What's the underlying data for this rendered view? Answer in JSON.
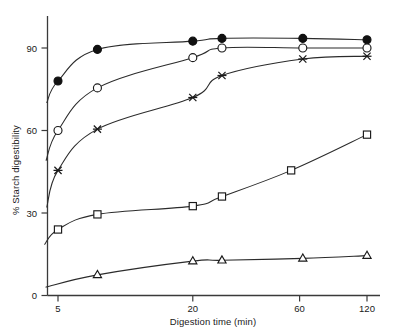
{
  "chart_data": {
    "type": "line",
    "title": "",
    "xlabel": "Digestion time (min)",
    "ylabel": "% Starch digestibility",
    "xscale": "log-like",
    "xticks": [
      5,
      20,
      60,
      120
    ],
    "xtick_labels": [
      "5",
      "20",
      "60",
      "120"
    ],
    "yticks": [
      0,
      30,
      60,
      90
    ],
    "ytick_labels": [
      "0",
      "30",
      "60",
      "90"
    ],
    "xlim": [
      4.0,
      130
    ],
    "ylim": [
      0,
      100
    ],
    "grid": false,
    "legend": "none",
    "series": [
      {
        "name": "filled-circle",
        "marker": "filled-circle",
        "x": [
          5,
          7.5,
          20,
          27,
          62,
          120
        ],
        "y": [
          78,
          89.5,
          92.5,
          93.5,
          93.5,
          93.0
        ]
      },
      {
        "name": "open-circle",
        "marker": "open-circle",
        "x": [
          5,
          7.5,
          20,
          27,
          62,
          120
        ],
        "y": [
          60,
          75.5,
          86.5,
          90,
          90,
          90
        ]
      },
      {
        "name": "cross",
        "marker": "cross",
        "x": [
          5,
          7.5,
          20,
          27,
          62,
          120
        ],
        "y": [
          45.5,
          60.5,
          72,
          80,
          86,
          87
        ]
      },
      {
        "name": "open-square",
        "marker": "open-square",
        "x": [
          5,
          7.5,
          20,
          27,
          55,
          120
        ],
        "y": [
          24,
          29.5,
          32.5,
          36,
          45.5,
          58.5
        ]
      },
      {
        "name": "open-triangle",
        "marker": "open-triangle",
        "x": [
          7.5,
          20,
          27,
          62,
          120
        ],
        "y": [
          7.5,
          12.5,
          12.8,
          13.5,
          14.5
        ]
      }
    ]
  },
  "labels": {
    "xlabel": "Digestion time (min)",
    "ylabel": "% Starch digestibility"
  }
}
